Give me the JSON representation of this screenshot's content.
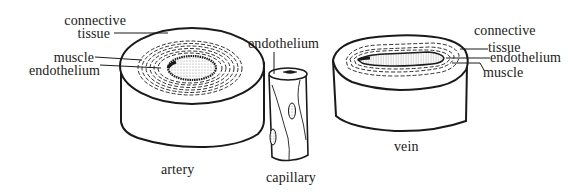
{
  "diagram": {
    "type": "biology-illustration",
    "vessels": [
      {
        "name": "artery",
        "caption": "artery",
        "labels": {
          "connective_line1": "connective",
          "connective_line2": "tissue",
          "muscle": "muscle",
          "endothelium": "endothelium"
        }
      },
      {
        "name": "capillary",
        "caption": "capillary",
        "labels": {
          "endothelium": "endothelium"
        }
      },
      {
        "name": "vein",
        "caption": "vein",
        "labels": {
          "connective_line1": "connective",
          "connective_line2": "tissue",
          "endothelium": "endothelium",
          "muscle": "muscle"
        }
      }
    ],
    "colors": {
      "ink": "#1a1a1a",
      "background": "#ffffff",
      "lumen_stipple": "#9a9a9a"
    }
  }
}
